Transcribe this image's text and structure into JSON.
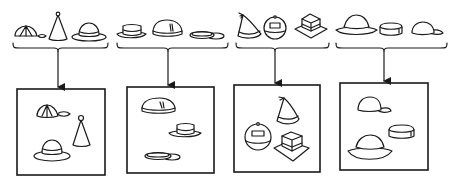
{
  "diagram": {
    "groups": [
      {
        "id": 1,
        "hats": [
          "baseball-cap",
          "party-cone-hat",
          "round-brim-hat"
        ],
        "box_hats": [
          "baseball-cap",
          "party-cone-hat",
          "round-brim-hat"
        ]
      },
      {
        "id": 2,
        "hats": [
          "fedora",
          "dome-beret-hat",
          "flat-visor-cap"
        ],
        "box_hats": [
          "dome-beret-hat",
          "fedora",
          "flat-visor-cap"
        ]
      },
      {
        "id": 3,
        "hats": [
          "tasseled-cone-hat",
          "round-helmet",
          "square-top-hat"
        ],
        "box_hats": [
          "tasseled-cone-hat",
          "round-helmet",
          "square-top-hat"
        ]
      },
      {
        "id": 4,
        "hats": [
          "wide-brim-sun-hat",
          "pillbox-hat",
          "baseball-cap"
        ],
        "box_hats": [
          "baseball-cap",
          "pillbox-hat",
          "wide-brim-sun-hat"
        ]
      }
    ],
    "colors": {
      "line": "#1a1a1a",
      "background": "#ffffff"
    }
  }
}
